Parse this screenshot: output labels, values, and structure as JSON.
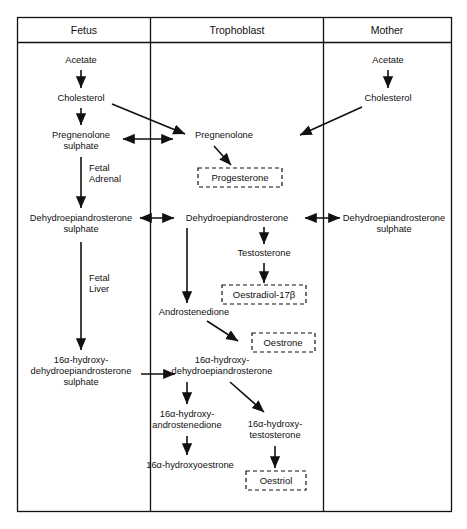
{
  "figure": {
    "type": "biochemical-pathway-diagram",
    "columns": [
      {
        "id": "fetus",
        "header": "Fetus"
      },
      {
        "id": "trophoblast",
        "header": "Trophoblast"
      },
      {
        "id": "mother",
        "header": "Mother"
      }
    ],
    "colors": {
      "line": "#111111",
      "text": "#111111",
      "background": "#ffffff"
    },
    "fetus": {
      "acetate": "Acetate",
      "cholesterol": "Cholesterol",
      "pregnenolone_sulphate_l1": "Pregnenolone",
      "pregnenolone_sulphate_l2": "sulphate",
      "fetal_adrenal_l1": "Fetal",
      "fetal_adrenal_l2": "Adrenal",
      "dhea_sulphate_l1": "Dehydroepiandrosterone",
      "dhea_sulphate_l2": "sulphate",
      "fetal_liver_l1": "Fetal",
      "fetal_liver_l2": "Liver",
      "oh_dhea_sulphate_l1": "16α-hydroxy-",
      "oh_dhea_sulphate_l2": "dehydroepiandrosterone",
      "oh_dhea_sulphate_l3": "sulphate"
    },
    "trophoblast": {
      "pregnenolone": "Pregnenolone",
      "progesterone": "Progesterone",
      "dhea": "Dehydroepiandrosterone",
      "testosterone": "Testosterone",
      "oestradiol": "Oestradiol-17β",
      "androstenedione": "Androstenedione",
      "oestrone": "Oestrone",
      "oh_dhea_l1": "16α-hydroxy-",
      "oh_dhea_l2": "dehydroepiandrosterone",
      "oh_androstenedione_l1": "16α-hydroxy-",
      "oh_androstenedione_l2": "androstenedione",
      "oh_oestrone": "16α-hydroxyoestrone",
      "oh_testosterone_l1": "16α-hydroxy-",
      "oh_testosterone_l2": "testosterone",
      "oestriol": "Oestriol"
    },
    "mother": {
      "acetate": "Acetate",
      "cholesterol": "Cholesterol",
      "dhea_sulphate_l1": "Dehydroepiandrosterone",
      "dhea_sulphate_l2": "sulphate"
    }
  }
}
